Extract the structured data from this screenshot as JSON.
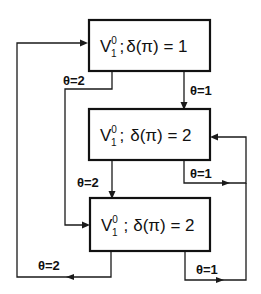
{
  "diagram": {
    "nodes": [
      {
        "id": "state1",
        "var": "V",
        "sup": "0",
        "sub": "1",
        "sep": ";",
        "cond": "δ(π) = 1"
      },
      {
        "id": "state2",
        "var": "V",
        "sup": "0",
        "sub": "1",
        "sep": ";",
        "cond": "δ(π) = 2"
      },
      {
        "id": "state3",
        "var": "V",
        "sup": "0",
        "sub": "1",
        "sep": ";",
        "cond": "δ(π) = 2"
      }
    ],
    "edges": [
      {
        "from": "state1",
        "to": "state2",
        "label": "θ=1"
      },
      {
        "from": "state1",
        "to": "state3",
        "label": "θ=2"
      },
      {
        "from": "state2",
        "to": "state3",
        "label": "θ=2"
      },
      {
        "from": "state2",
        "to": "state2",
        "label": "θ=1"
      },
      {
        "from": "state3",
        "to": "state2",
        "label": "θ=1"
      },
      {
        "from": "state3",
        "to": "state1",
        "label": "θ=2"
      }
    ]
  }
}
